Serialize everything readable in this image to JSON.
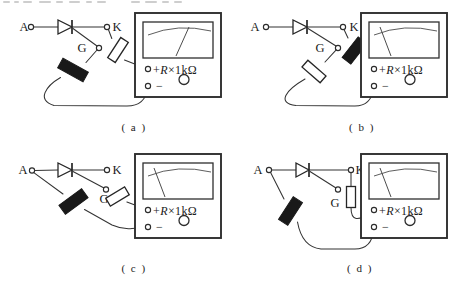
{
  "figure": {
    "type": "circuit-test-diagram",
    "panel_count": 4
  },
  "meter": {
    "positive_sign": "+",
    "range_letter": "R",
    "range_value": "×1kΩ",
    "negative_sign": "−"
  },
  "panels": [
    {
      "id": "a",
      "caption": "( a )",
      "labels": {
        "anode": "A",
        "gate": "G",
        "cathode": "K"
      },
      "connections": {
        "positive": {
          "terminal": "K",
          "pen": "white"
        },
        "negative": {
          "terminal": "G",
          "pen": "black"
        }
      },
      "meter": {
        "needle": "deflected-right"
      }
    },
    {
      "id": "b",
      "caption": "( b )",
      "labels": {
        "anode": "A",
        "gate": "G",
        "cathode": "K"
      },
      "connections": {
        "positive": {
          "terminal": "K",
          "pen": "black"
        },
        "negative": {
          "terminal": "G",
          "pen": "white"
        }
      },
      "meter": {
        "needle": "at-rest-left"
      }
    },
    {
      "id": "c",
      "caption": "( c )",
      "labels": {
        "anode": "A",
        "gate": "G",
        "cathode": "K"
      },
      "connections": {
        "positive": {
          "terminal": "G",
          "pen": "white"
        },
        "negative": {
          "terminal": "A",
          "pen": "black"
        }
      },
      "meter": {
        "needle": "at-rest-left"
      }
    },
    {
      "id": "d",
      "caption": "( d )",
      "labels": {
        "anode": "A",
        "gate": "G",
        "cathode": "K"
      },
      "connections": {
        "positive": {
          "terminal": "K",
          "pen": "white"
        },
        "negative": {
          "terminal": "A",
          "pen": "black"
        }
      },
      "meter": {
        "needle": "at-rest-left"
      }
    }
  ]
}
